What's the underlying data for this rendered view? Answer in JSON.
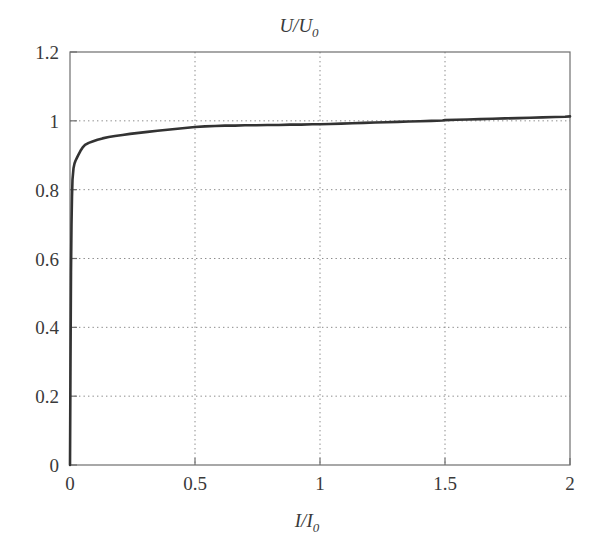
{
  "chart_data": {
    "type": "line",
    "title": "U/U0",
    "title_parts": {
      "main": "U/U",
      "subscript": "0"
    },
    "xlabel": "I/I0",
    "xlabel_parts": {
      "main": "I/I",
      "subscript": "0"
    },
    "ylabel": "",
    "xlim": [
      0,
      2
    ],
    "ylim": [
      0,
      1.2
    ],
    "xticks": [
      0,
      0.5,
      1,
      1.5,
      2
    ],
    "xtick_labels": [
      "0",
      "0.5",
      "1",
      "1.5",
      "2"
    ],
    "yticks": [
      0,
      0.2,
      0.4,
      0.6,
      0.8,
      1,
      1.2
    ],
    "ytick_labels": [
      "0",
      "0.2",
      "0.4",
      "0.6",
      "0.8",
      "1",
      "1.2"
    ],
    "grid": true,
    "grid_style": "dotted",
    "legend": null,
    "line_color": "#333333",
    "line_width": 2.6,
    "background": "#ffffff",
    "series": [
      {
        "name": "U/U0 vs I/I0",
        "x": [
          0.0,
          0.002,
          0.004,
          0.006,
          0.008,
          0.01,
          0.014,
          0.018,
          0.022,
          0.028,
          0.034,
          0.042,
          0.05,
          0.06,
          0.075,
          0.09,
          0.11,
          0.13,
          0.155,
          0.18,
          0.21,
          0.24,
          0.275,
          0.31,
          0.35,
          0.39,
          0.43,
          0.47,
          0.5,
          0.54,
          0.58,
          0.62,
          0.66,
          0.7,
          0.745,
          0.79,
          0.835,
          0.88,
          0.925,
          0.97,
          1.0,
          1.04,
          1.085,
          1.13,
          1.175,
          1.22,
          1.265,
          1.31,
          1.355,
          1.4,
          1.445,
          1.49,
          1.5,
          1.545,
          1.59,
          1.64,
          1.69,
          1.74,
          1.79,
          1.84,
          1.89,
          1.94,
          1.98,
          2.0
        ],
        "y": [
          0.0,
          0.3,
          0.56,
          0.7,
          0.78,
          0.83,
          0.862,
          0.876,
          0.884,
          0.893,
          0.902,
          0.913,
          0.922,
          0.93,
          0.936,
          0.94,
          0.945,
          0.949,
          0.953,
          0.956,
          0.959,
          0.962,
          0.965,
          0.968,
          0.971,
          0.974,
          0.977,
          0.98,
          0.982,
          0.984,
          0.985,
          0.986,
          0.986,
          0.987,
          0.987,
          0.988,
          0.988,
          0.989,
          0.989,
          0.99,
          0.99,
          0.991,
          0.992,
          0.993,
          0.994,
          0.995,
          0.996,
          0.997,
          0.998,
          0.999,
          1.0,
          1.001,
          1.002,
          1.003,
          1.004,
          1.005,
          1.006,
          1.007,
          1.008,
          1.009,
          1.01,
          1.011,
          1.012,
          1.013
        ]
      }
    ],
    "annotations": [
      {
        "text": "Curve rises near-vertically at I/I0 = 0 to about 0.88, then asymptotically approaches and slightly exceeds 1.0"
      }
    ]
  },
  "plot_geometry": {
    "left": 70,
    "right": 570,
    "top": 52,
    "bottom": 465
  }
}
